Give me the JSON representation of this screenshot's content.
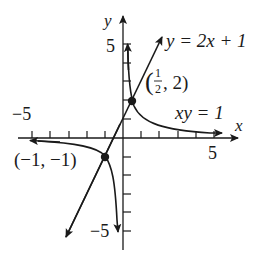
{
  "graph": {
    "x_axis_label": "x",
    "y_axis_label": "y",
    "x_min_label": "−5",
    "x_max_label": "5",
    "y_max_label": "5",
    "y_min_label": "−5",
    "line_equation": "y = 2x + 1",
    "curve_equation": "xy = 1",
    "point_a": {
      "label_open": "(",
      "num": "1",
      "den": "2",
      "rest": ", 2)",
      "x": 0.5,
      "y": 2
    },
    "point_b": {
      "label": "(−1, −1)",
      "x": -1,
      "y": -1
    },
    "colors": {
      "ink": "#1a1a1a",
      "background": "#ffffff"
    }
  }
}
